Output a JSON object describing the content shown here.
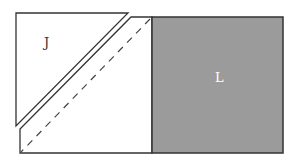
{
  "diagram": {
    "shapes": [
      {
        "id": "J",
        "label": "J",
        "type": "triangle",
        "fill": "#ffffff"
      },
      {
        "id": "middle",
        "label": "",
        "type": "pentagon",
        "fill": "#ffffff",
        "dashed_diagonal": true
      },
      {
        "id": "L",
        "label": "L",
        "type": "square",
        "fill": "#9b9b9b"
      }
    ],
    "labels": {
      "J": "J",
      "L": "L"
    },
    "colors": {
      "stroke": "#333333",
      "square_fill": "#9b9b9b",
      "square_label": "#ffffff"
    }
  }
}
